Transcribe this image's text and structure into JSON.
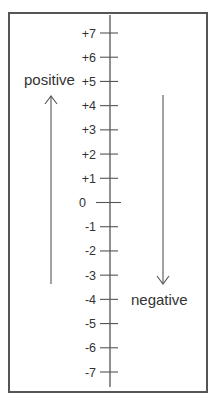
{
  "diagram": {
    "axis": {
      "ticks": [
        {
          "label": "+7",
          "value": 7
        },
        {
          "label": "+6",
          "value": 6
        },
        {
          "label": "+5",
          "value": 5
        },
        {
          "label": "+4",
          "value": 4
        },
        {
          "label": "+3",
          "value": 3
        },
        {
          "label": "+2",
          "value": 2
        },
        {
          "label": "+1",
          "value": 1
        },
        {
          "label": "0",
          "value": 0
        },
        {
          "label": "-1",
          "value": -1
        },
        {
          "label": "-2",
          "value": -2
        },
        {
          "label": "-3",
          "value": -3
        },
        {
          "label": "-4",
          "value": -4
        },
        {
          "label": "-5",
          "value": -5
        },
        {
          "label": "-6",
          "value": -6
        },
        {
          "label": "-7",
          "value": -7
        }
      ]
    },
    "positive_arrow": {
      "label": "positive",
      "direction": "up"
    },
    "negative_arrow": {
      "label": "negative",
      "direction": "down"
    },
    "colors": {
      "line": "#555555",
      "text": "#333333",
      "border": "#555555",
      "background": "#ffffff"
    }
  }
}
